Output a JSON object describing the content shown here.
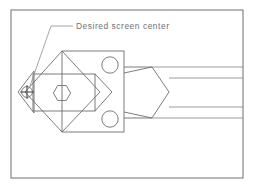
{
  "drawing": {
    "title": "Mechanical part technical line drawing",
    "annotation": {
      "label": "Desired screen center",
      "leader_target_x": 30,
      "leader_target_y": 86
    },
    "colors": {
      "background": "#ffffff",
      "frame_stroke": "#7a7a7a",
      "part_stroke": "#6e6e6e",
      "light_stroke": "#8a8a8a",
      "leader_stroke": "#8e8e98",
      "text": "#6f6f77",
      "crosshair": "#404040"
    },
    "frame": {
      "name": "drawing-border",
      "x": 11,
      "y": 10,
      "width": 232,
      "height": 168
    },
    "shapes": {
      "left_tip": {
        "name": "left-pointed-tip",
        "points": "18,92 34,71 34,113 18,92"
      },
      "diamond": {
        "name": "rotated-square-diamond",
        "points": "62,51 100,92 62,132 25,92"
      },
      "body_square": {
        "name": "main-square-body",
        "x": 62,
        "y": 51,
        "width": 62,
        "height": 81
      },
      "circles": [
        {
          "name": "mounting-hole-top",
          "cx": 110,
          "cy": 65,
          "r": 8.2
        },
        {
          "name": "mounting-hole-bottom",
          "cx": 110,
          "cy": 119,
          "r": 8.2
        }
      ],
      "overlay_rect": {
        "name": "overlay-rectangle",
        "x": 33,
        "y": 74,
        "width": 62,
        "height": 37
      },
      "hexagon": {
        "name": "hex-socket",
        "cx": 62,
        "cy": 93,
        "r": 8.6
      },
      "arrow_notch": {
        "name": "v-notch-arrow",
        "points": "95,74 112,92 95,111"
      },
      "pentagon": {
        "name": "pentagon-collar",
        "points": "124,67 152,67 169,92 152,118 124,118"
      },
      "shaft_lines": [
        {
          "name": "shaft-line-1",
          "x1": 152,
          "y1": 67,
          "x2": 243,
          "y2": 67
        },
        {
          "name": "shaft-line-2",
          "x1": 169,
          "y1": 78,
          "x2": 243,
          "y2": 78
        },
        {
          "name": "shaft-line-3",
          "x1": 169,
          "y1": 107,
          "x2": 243,
          "y2": 107
        },
        {
          "name": "shaft-line-4",
          "x1": 152,
          "y1": 118,
          "x2": 243,
          "y2": 118
        }
      ],
      "connector_lines": [
        {
          "name": "connector-upper",
          "x1": 124,
          "y1": 73,
          "x2": 152,
          "y2": 67
        },
        {
          "name": "connector-lower",
          "x1": 124,
          "y1": 112,
          "x2": 152,
          "y2": 118
        }
      ],
      "target_marker": {
        "name": "screen-center-target",
        "cx": 27,
        "cy": 92,
        "r": 5.4
      }
    },
    "leader": {
      "name": "annotation-leader",
      "path": "M30,86 L51,26 L73,26"
    },
    "text_position": {
      "x": 76,
      "y": 29
    }
  }
}
